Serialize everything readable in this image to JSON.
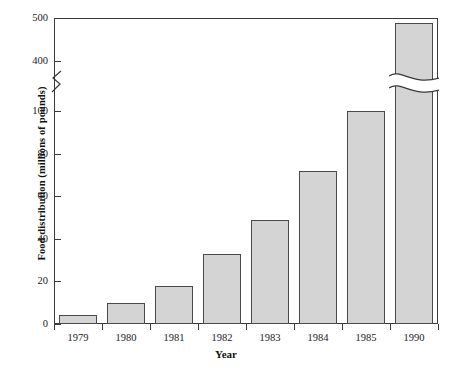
{
  "chart_data": {
    "type": "bar",
    "title": "",
    "xlabel": "Year",
    "ylabel": "Food distribution (millions of pounds)",
    "categories": [
      "1979",
      "1980",
      "1981",
      "1982",
      "1983",
      "1984",
      "1985",
      "1990"
    ],
    "values": [
      4,
      10,
      18,
      33,
      49,
      72,
      100,
      488
    ],
    "ytick_labels": [
      "0",
      "20",
      "40",
      "60",
      "80",
      "100",
      "400",
      "500"
    ],
    "ytick_values": [
      0,
      20,
      40,
      60,
      80,
      100,
      400,
      500
    ],
    "axis_break": {
      "present": true,
      "between": [
        100,
        400
      ],
      "note": "y-axis broken between 100 and 400; the 1990 bar is drawn with a wave break"
    },
    "ylim_lower": [
      0,
      100
    ],
    "ylim_upper": [
      400,
      500
    ],
    "grid": false,
    "legend": null,
    "bar_color": "#d4d4d4",
    "bar_edge_color": "#4a4a4a",
    "axis_color": "#3a3a3a",
    "background_color": "#ffffff"
  }
}
